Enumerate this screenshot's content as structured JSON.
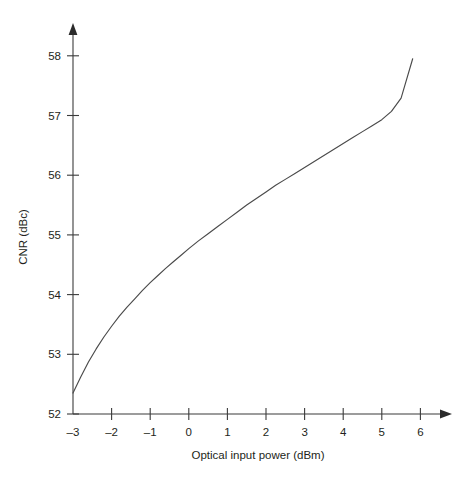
{
  "chart_data": {
    "type": "line",
    "title": "",
    "xlabel": "Optical input power (dBm)",
    "ylabel": "CNR (dBc)",
    "xlim": [
      -3,
      6
    ],
    "ylim": [
      52,
      58
    ],
    "grid": false,
    "legend": "none",
    "xticks": [
      "-3",
      "-2",
      "-1",
      "0",
      "1",
      "2",
      "3",
      "4",
      "5",
      "6"
    ],
    "xtick_values": [
      -3,
      -2,
      -1,
      0,
      1,
      2,
      3,
      4,
      5,
      6
    ],
    "yticks": [
      "52",
      "53",
      "54",
      "55",
      "56",
      "57",
      "58"
    ],
    "ytick_values": [
      52,
      53,
      54,
      55,
      56,
      57,
      58
    ],
    "series": [
      {
        "name": "CNR vs optical input power",
        "x": [
          -3.0,
          -2.8,
          -2.6,
          -2.4,
          -2.2,
          -2.0,
          -1.8,
          -1.6,
          -1.4,
          -1.2,
          -1.0,
          -0.8,
          -0.6,
          -0.4,
          -0.2,
          0.0,
          0.25,
          0.5,
          0.75,
          1.0,
          1.25,
          1.5,
          1.75,
          2.0,
          2.25,
          2.5,
          2.75,
          3.0,
          3.25,
          3.5,
          3.75,
          4.0,
          4.25,
          4.5,
          4.75,
          5.0,
          5.25,
          5.5,
          5.8
        ],
        "y": [
          52.35,
          52.62,
          52.87,
          53.09,
          53.29,
          53.47,
          53.64,
          53.79,
          53.93,
          54.07,
          54.2,
          54.32,
          54.44,
          54.55,
          54.66,
          54.77,
          54.9,
          55.02,
          55.14,
          55.26,
          55.38,
          55.5,
          55.61,
          55.72,
          55.83,
          55.93,
          56.03,
          56.13,
          56.23,
          56.33,
          56.43,
          56.53,
          56.63,
          56.73,
          56.83,
          56.93,
          57.07,
          57.29,
          57.95
        ]
      }
    ],
    "annotations": []
  },
  "axes": {
    "x_title": "Optical input power (dBm)",
    "y_title": "CNR (dBc)"
  }
}
